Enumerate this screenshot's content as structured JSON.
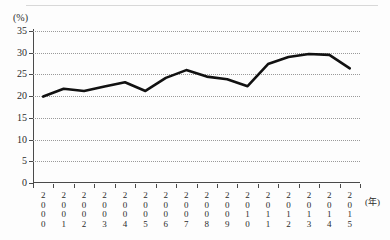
{
  "figure": {
    "unit_label": "(%)",
    "x_unit_label": "(年)"
  },
  "chart_data": {
    "type": "line",
    "title": "",
    "subtitle": "",
    "xlabel": "(年)",
    "ylabel": "(%)",
    "ylim": [
      0,
      35
    ],
    "ytick_step": 5,
    "yticks": [
      "35",
      "30",
      "25",
      "20",
      "15",
      "10",
      "5",
      "0"
    ],
    "ytick_values": [
      35,
      30,
      25,
      20,
      15,
      10,
      5,
      0
    ],
    "grid": true,
    "grid_style": "dotted-horizontal",
    "legend": "none",
    "categories": [
      "2000",
      "2001",
      "2002",
      "2003",
      "2004",
      "2005",
      "2006",
      "2007",
      "2008",
      "2009",
      "2010",
      "2011",
      "2012",
      "2013",
      "2014",
      "2015"
    ],
    "x_tick_labels_vertical": true,
    "series": [
      {
        "name": "",
        "color": "#111111",
        "line_width": 2.6,
        "values": [
          19.9,
          21.7,
          21.2,
          22.2,
          23.2,
          21.2,
          24.2,
          26.0,
          24.5,
          23.9,
          22.3,
          27.4,
          29.0,
          29.7,
          29.5,
          26.4
        ]
      }
    ],
    "annotations": []
  },
  "colors": {
    "line": "#111111",
    "axis": "#4a4a4a",
    "grid": "#9a9a9a",
    "text": "#2b2b2b",
    "background": "#fdfdfd"
  }
}
